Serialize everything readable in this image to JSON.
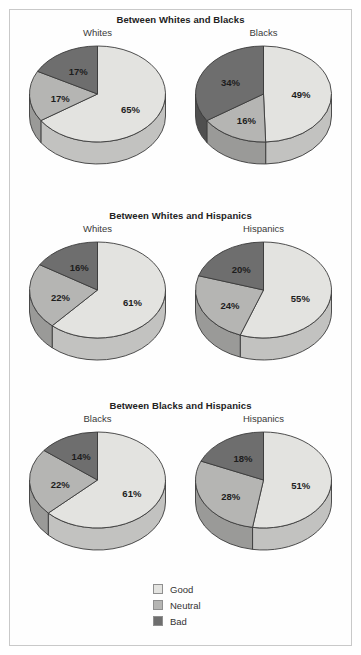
{
  "colors": {
    "good": "#e3e3e0",
    "neutral": "#b5b5b3",
    "bad": "#6e6e6e",
    "good_side": "#c2c2c0",
    "neutral_side": "#9a9a98",
    "bad_side": "#4f4f4f",
    "outline": "#3b3b3b",
    "text": "#222222",
    "border": "#c9c9c9",
    "background": "#ffffff"
  },
  "legend": {
    "items": [
      {
        "label": "Good",
        "color": "#e3e3e0"
      },
      {
        "label": "Neutral",
        "color": "#b5b5b3"
      },
      {
        "label": "Bad",
        "color": "#6e6e6e"
      }
    ]
  },
  "chart_data": {
    "type": "pie",
    "title": "",
    "series_names": [
      "Good",
      "Neutral",
      "Bad"
    ],
    "legend_position": "bottom-center",
    "value_suffix": "%",
    "panels": [
      {
        "title": "Between Whites and Blacks",
        "pies": [
          {
            "label": "Whites",
            "categories": [
              "Good",
              "Neutral",
              "Bad"
            ],
            "values": [
              65,
              17,
              17
            ],
            "labels": [
              "65%",
              "17%",
              "17%"
            ]
          },
          {
            "label": "Blacks",
            "categories": [
              "Good",
              "Neutral",
              "Bad"
            ],
            "values": [
              49,
              16,
              34
            ],
            "labels": [
              "49%",
              "16%",
              "34%"
            ]
          }
        ]
      },
      {
        "title": "Between Whites and Hispanics",
        "pies": [
          {
            "label": "Whites",
            "categories": [
              "Good",
              "Neutral",
              "Bad"
            ],
            "values": [
              61,
              22,
              16
            ],
            "labels": [
              "61%",
              "22%",
              "16%"
            ]
          },
          {
            "label": "Hispanics",
            "categories": [
              "Good",
              "Neutral",
              "Bad"
            ],
            "values": [
              55,
              24,
              20
            ],
            "labels": [
              "55%",
              "24%",
              "20%"
            ]
          }
        ]
      },
      {
        "title": "Between Blacks and Hispanics",
        "pies": [
          {
            "label": "Blacks",
            "categories": [
              "Good",
              "Neutral",
              "Bad"
            ],
            "values": [
              61,
              22,
              14
            ],
            "labels": [
              "61%",
              "22%",
              "14%"
            ]
          },
          {
            "label": "Hispanics",
            "categories": [
              "Good",
              "Neutral",
              "Bad"
            ],
            "values": [
              51,
              28,
              18
            ],
            "labels": [
              "51%",
              "28%",
              "18%"
            ]
          }
        ]
      }
    ]
  }
}
